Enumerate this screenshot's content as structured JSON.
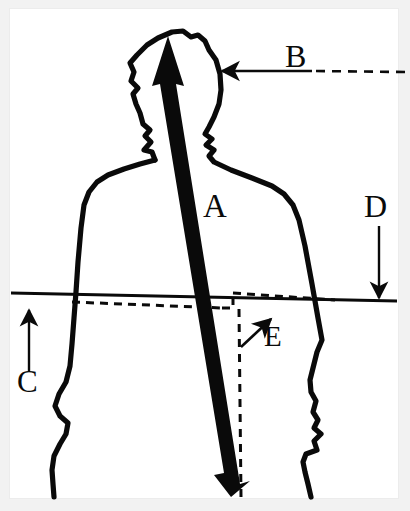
{
  "figure": {
    "background_color": "#f2f2f2",
    "panel_color": "#ffffff",
    "ink_color": "#0a0a0a",
    "width": 410,
    "height": 511
  },
  "subject": {
    "name": "human-silhouette",
    "description": "Outline drawing of a person's head, shoulders, torso and arms seen from the front",
    "stroke_color": "#0a0a0a"
  },
  "annotations": [
    {
      "id": "A",
      "label": "A",
      "label_x": 212,
      "label_y": 212,
      "marker": "thick-double-arrow",
      "direction": "both",
      "description": "Thick black double-headed arrow running from the top of the head down through the torso to the bottom of the figure, indicating the long body axis",
      "from_x": 168,
      "from_y": 38,
      "to_x": 233,
      "to_y": 495
    },
    {
      "id": "B",
      "label": "B",
      "label_x": 287,
      "label_y": 60,
      "marker": "arrow-left",
      "direction": "left",
      "description": "Horizontal arrow pointing left toward the side of the head; solid near the head and dashed toward the right edge",
      "from_x": 405,
      "from_y": 72,
      "to_x": 218,
      "to_y": 71,
      "solid_from_x": 312,
      "dash_pattern": "9 7"
    },
    {
      "id": "C",
      "label": "C",
      "label_x": 21,
      "label_y": 372,
      "marker": "arrow-up",
      "direction": "up",
      "description": "Short vertical arrow at the far left pointing up to the solid horizontal reference line",
      "from_x": 29,
      "from_y": 372,
      "to_x": 29,
      "to_y": 308
    },
    {
      "id": "D",
      "label": "D",
      "label_x": 366,
      "label_y": 196,
      "marker": "arrow-down",
      "direction": "down",
      "description": "Vertical arrow at the far right pointing down to the solid horizontal reference line",
      "from_x": 379,
      "from_y": 226,
      "to_x": 379,
      "to_y": 299
    },
    {
      "id": "E",
      "label": "E",
      "label_x": 268,
      "label_y": 328,
      "marker": "arrow-up-right",
      "direction": "up-right",
      "description": "Small diagonal arrow pointing up and to the right at the inner dashed step corner",
      "from_x": 241,
      "from_y": 347,
      "to_x": 272,
      "to_y": 318
    }
  ],
  "reference_lines": [
    {
      "name": "solid-horizontal-reference-line",
      "style": "solid",
      "description": "Solid nearly-horizontal line spanning the full panel width, sloping very slightly downward to the right",
      "x1": 11,
      "y1": 293,
      "x2": 397,
      "y2": 301
    },
    {
      "name": "dashed-horizontal-reference-line",
      "style": "dashed",
      "description": "Dashed nearly-horizontal line beginning at the figure's left arm and sloping slightly downward to the right, ending in a stepped corner",
      "x1": 72,
      "y1": 302,
      "x2": 222,
      "y2": 308,
      "dash_pattern": "8 6"
    },
    {
      "name": "dashed-step-upper-segment",
      "style": "dashed",
      "description": "Upper dashed horizontal segment of the step, running right from the step corner and crossing the right arm",
      "x1": 233,
      "y1": 293,
      "x2": 335,
      "y2": 300,
      "dash_pattern": "8 6"
    },
    {
      "name": "dashed-step-riser",
      "style": "dashed",
      "description": "Short vertical dashed riser joining the lower dashed line to the upper dashed segment",
      "x1": 233,
      "y1": 293,
      "x2": 233,
      "y2": 308,
      "dash_pattern": "8 6"
    },
    {
      "name": "dashed-vertical-drop-line",
      "style": "dashed",
      "description": "Long vertical dashed line dropping from the step corner to the bottom of the panel beside the thick arrow head",
      "x1": 240,
      "y1": 308,
      "x2": 240,
      "y2": 497,
      "dash_pattern": "8 7"
    }
  ]
}
